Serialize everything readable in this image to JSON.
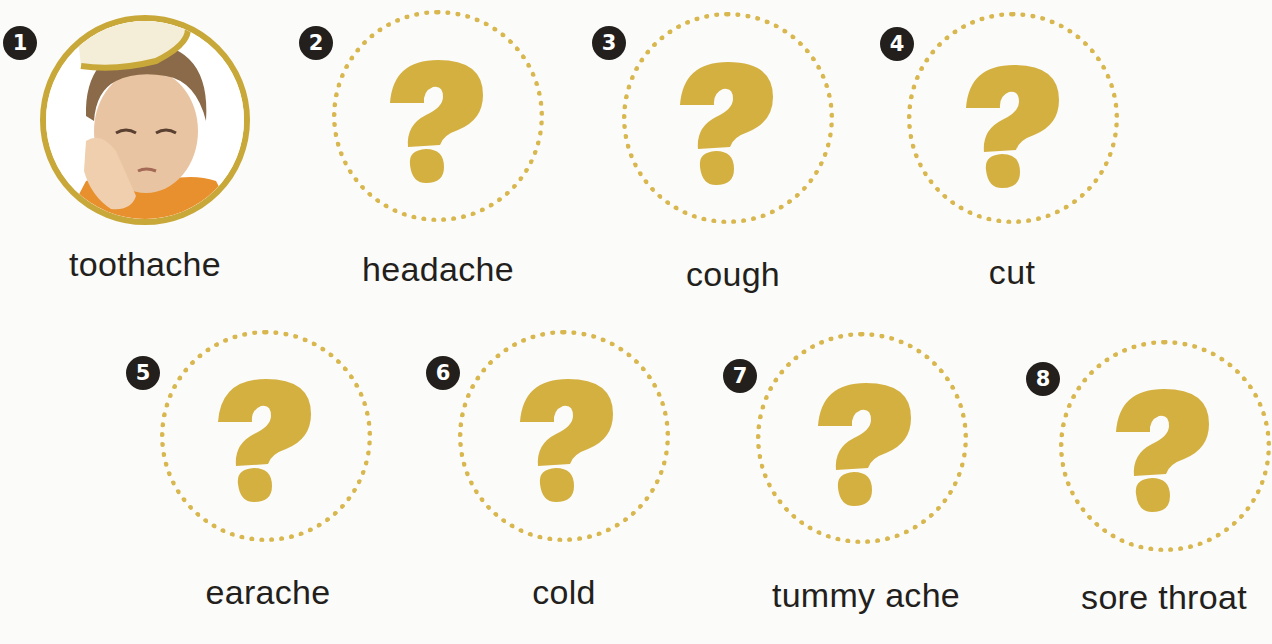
{
  "colors": {
    "accent_gold": "#d9b74f",
    "question_mark": "#d4b041",
    "badge_bg": "#231f1c",
    "badge_text": "#ffffff",
    "label_text": "#231f1c",
    "background": "#fbfbfa"
  },
  "items": [
    {
      "number": "1",
      "label": "toothache",
      "icon": "photo-boy-toothache"
    },
    {
      "number": "2",
      "label": "headache",
      "icon": "question-mark-icon"
    },
    {
      "number": "3",
      "label": "cough",
      "icon": "question-mark-icon"
    },
    {
      "number": "4",
      "label": "cut",
      "icon": "question-mark-icon"
    },
    {
      "number": "5",
      "label": "earache",
      "icon": "question-mark-icon"
    },
    {
      "number": "6",
      "label": "cold",
      "icon": "question-mark-icon"
    },
    {
      "number": "7",
      "label": "tummy ache",
      "icon": "question-mark-icon"
    },
    {
      "number": "8",
      "label": "sore throat",
      "icon": "question-mark-icon"
    }
  ]
}
